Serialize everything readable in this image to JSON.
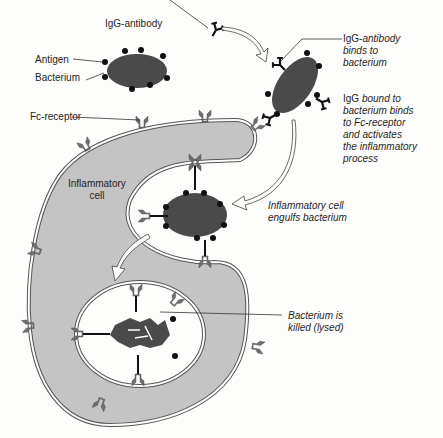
{
  "figure": {
    "cropped_header_text": "— — — — — — — — — — — — —",
    "colors": {
      "cell_fill": "#c4c4c4",
      "bacterium_fill": "#4a4a4a",
      "receptor_fill": "#6f6f6f",
      "antigen_dot": "#111111",
      "membrane_outline": "#555555",
      "background": "#fdfdfb"
    }
  },
  "labels": {
    "igg_antibody": "IgG-antibody",
    "antigen": "Antigen",
    "bacterium": "Bacterium",
    "fc_receptor": "Fc-receptor",
    "inflammatory_cell": [
      "Inflammatory",
      "cell"
    ]
  },
  "steps": [
    {
      "id": "binds",
      "lines": [
        "IgG-antibody",
        "binds to",
        "bacterium"
      ],
      "first_word_upright": "IgG-",
      "first_rest": "antibody"
    },
    {
      "id": "activates",
      "lines": [
        "IgG bound to",
        "bacterium binds",
        "to Fc-receptor",
        "and activates",
        "the inflammatory",
        "process"
      ],
      "first_word_upright": "IgG",
      "first_rest": " bound to"
    },
    {
      "id": "engulfs",
      "lines": [
        "Inflammatory cell",
        "engulfs bacterium"
      ]
    },
    {
      "id": "killed",
      "lines": [
        "Bacterium is",
        "killed (lysed)"
      ]
    }
  ]
}
